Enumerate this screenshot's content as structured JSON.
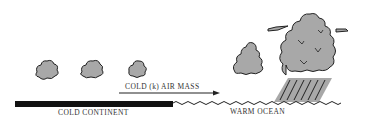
{
  "diagram": {
    "labels": {
      "air_mass": "COLD (k) AIR MASS",
      "continent": "COLD CONTINENT",
      "ocean": "WARM OCEAN"
    },
    "colors": {
      "cloud_fill": "#a8a8a8",
      "outline": "#222222",
      "land": "#111111",
      "text": "#333333"
    }
  }
}
